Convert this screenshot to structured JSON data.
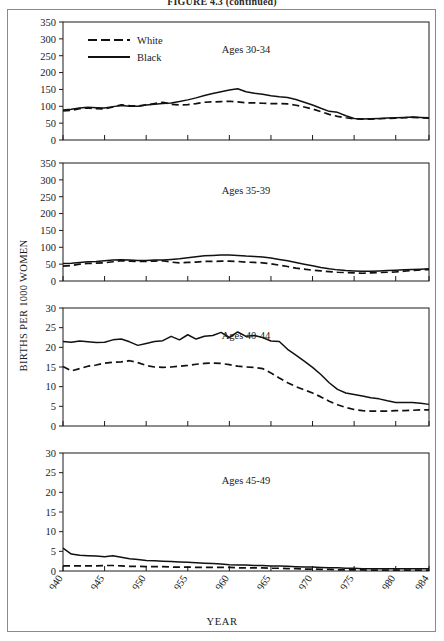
{
  "figure": {
    "title": "FIGURE 4.3 (continued)",
    "ylabel": "BIRTHS PER 1000 WOMEN",
    "xlabel": "YEAR"
  },
  "legend": {
    "position": "top-left-panel-1",
    "entries": [
      {
        "label": "White",
        "style": "dashed"
      },
      {
        "label": "Black",
        "style": "solid"
      }
    ]
  },
  "chart_data": [
    {
      "type": "line",
      "title": "Ages 30-34",
      "xlabel": "YEAR",
      "ylabel": "BIRTHS PER 1000 WOMEN",
      "xlim": [
        1940,
        1984
      ],
      "ylim": [
        0,
        350
      ],
      "yticks": [
        0,
        50,
        100,
        150,
        200,
        250,
        300,
        350
      ],
      "xticks": [
        1940,
        1945,
        1950,
        1955,
        1960,
        1965,
        1970,
        1975,
        1980,
        1984
      ],
      "grid": false,
      "legend": "top-left",
      "x": [
        1940,
        1941,
        1942,
        1943,
        1944,
        1945,
        1946,
        1947,
        1948,
        1949,
        1950,
        1951,
        1952,
        1953,
        1954,
        1955,
        1956,
        1957,
        1958,
        1959,
        1960,
        1961,
        1962,
        1963,
        1964,
        1965,
        1966,
        1967,
        1968,
        1969,
        1970,
        1971,
        1972,
        1973,
        1974,
        1975,
        1976,
        1977,
        1978,
        1979,
        1980,
        1981,
        1982,
        1983,
        1984
      ],
      "series": [
        {
          "name": "White",
          "style": "dashed",
          "values": [
            86,
            88,
            93,
            95,
            93,
            92,
            98,
            104,
            102,
            101,
            104,
            108,
            112,
            106,
            104,
            105,
            108,
            112,
            113,
            114,
            115,
            113,
            110,
            110,
            109,
            108,
            108,
            107,
            103,
            98,
            92,
            84,
            76,
            70,
            66,
            63,
            62,
            62,
            63,
            64,
            65,
            66,
            67,
            66,
            65
          ]
        },
        {
          "name": "Black",
          "style": "solid",
          "values": [
            89,
            91,
            95,
            97,
            96,
            95,
            99,
            102,
            100,
            100,
            104,
            106,
            108,
            110,
            114,
            119,
            125,
            132,
            138,
            143,
            148,
            152,
            143,
            139,
            136,
            131,
            128,
            126,
            120,
            112,
            104,
            94,
            85,
            82,
            72,
            64,
            62,
            63,
            64,
            65,
            66,
            67,
            68,
            67,
            66
          ]
        }
      ]
    },
    {
      "type": "line",
      "title": "Ages 35-39",
      "xlabel": "YEAR",
      "ylabel": "BIRTHS PER 1000 WOMEN",
      "xlim": [
        1940,
        1984
      ],
      "ylim": [
        0,
        350
      ],
      "yticks": [
        0,
        50,
        100,
        150,
        200,
        250,
        300,
        350
      ],
      "xticks": [
        1940,
        1945,
        1950,
        1955,
        1960,
        1965,
        1970,
        1975,
        1980,
        1984
      ],
      "grid": false,
      "x": [
        1940,
        1941,
        1942,
        1943,
        1944,
        1945,
        1946,
        1947,
        1948,
        1949,
        1950,
        1951,
        1952,
        1953,
        1954,
        1955,
        1956,
        1957,
        1958,
        1959,
        1960,
        1961,
        1962,
        1963,
        1964,
        1965,
        1966,
        1967,
        1968,
        1969,
        1970,
        1971,
        1972,
        1973,
        1974,
        1975,
        1976,
        1977,
        1978,
        1979,
        1980,
        1981,
        1982,
        1983,
        1984
      ],
      "series": [
        {
          "name": "White",
          "style": "dashed",
          "values": [
            44,
            46,
            50,
            52,
            53,
            54,
            57,
            60,
            59,
            58,
            58,
            59,
            60,
            56,
            54,
            55,
            56,
            58,
            58,
            59,
            59,
            58,
            56,
            55,
            54,
            51,
            47,
            43,
            38,
            35,
            32,
            30,
            28,
            26,
            25,
            24,
            23,
            24,
            25,
            26,
            27,
            29,
            31,
            33,
            34
          ]
        },
        {
          "name": "Black",
          "style": "solid",
          "values": [
            52,
            53,
            55,
            57,
            58,
            60,
            62,
            63,
            62,
            61,
            61,
            62,
            62,
            64,
            66,
            69,
            72,
            75,
            76,
            77,
            77,
            76,
            74,
            73,
            71,
            68,
            64,
            60,
            55,
            50,
            45,
            40,
            36,
            33,
            31,
            30,
            29,
            29,
            30,
            31,
            32,
            33,
            34,
            35,
            36
          ]
        }
      ]
    },
    {
      "type": "line",
      "title": "Ages 40-44",
      "xlabel": "YEAR",
      "ylabel": "BIRTHS PER 1000 WOMEN",
      "xlim": [
        1940,
        1984
      ],
      "ylim": [
        0,
        30
      ],
      "yticks": [
        0,
        5,
        10,
        15,
        20,
        25,
        30
      ],
      "xticks": [
        1940,
        1945,
        1950,
        1955,
        1960,
        1965,
        1970,
        1975,
        1980,
        1984
      ],
      "grid": false,
      "x": [
        1940,
        1941,
        1942,
        1943,
        1944,
        1945,
        1946,
        1947,
        1948,
        1949,
        1950,
        1951,
        1952,
        1953,
        1954,
        1955,
        1956,
        1957,
        1958,
        1959,
        1960,
        1961,
        1962,
        1963,
        1964,
        1965,
        1966,
        1967,
        1968,
        1969,
        1970,
        1971,
        1972,
        1973,
        1974,
        1975,
        1976,
        1977,
        1978,
        1979,
        1980,
        1981,
        1982,
        1983,
        1984
      ],
      "series": [
        {
          "name": "White",
          "style": "dashed",
          "values": [
            15.1,
            14.0,
            14.6,
            15.2,
            15.5,
            16.0,
            16.2,
            16.3,
            16.6,
            16.1,
            15.4,
            15.0,
            14.9,
            15.0,
            15.2,
            15.4,
            15.7,
            15.9,
            16.0,
            15.9,
            15.6,
            15.2,
            15.0,
            14.9,
            14.6,
            13.5,
            12.2,
            11.0,
            10.0,
            9.2,
            8.4,
            7.4,
            6.3,
            5.4,
            4.7,
            4.2,
            3.9,
            3.8,
            3.8,
            3.8,
            3.9,
            3.9,
            4.0,
            4.1,
            4.1
          ]
        },
        {
          "name": "Black",
          "style": "solid",
          "values": [
            21.5,
            21.3,
            21.6,
            21.4,
            21.2,
            21.3,
            21.9,
            22.1,
            21.4,
            20.5,
            21.0,
            21.5,
            21.7,
            22.8,
            21.9,
            23.2,
            22.1,
            22.8,
            23.0,
            23.8,
            22.5,
            23.9,
            22.8,
            23.0,
            22.5,
            21.6,
            21.5,
            19.5,
            18.0,
            16.5,
            14.9,
            13.1,
            11.0,
            9.3,
            8.4,
            8.0,
            7.6,
            7.2,
            6.9,
            6.4,
            6.0,
            6.0,
            6.0,
            5.8,
            5.5
          ]
        }
      ]
    },
    {
      "type": "line",
      "title": "Ages 45-49",
      "xlabel": "YEAR",
      "ylabel": "BIRTHS PER 1000 WOMEN",
      "xlim": [
        1940,
        1984
      ],
      "ylim": [
        0,
        30
      ],
      "yticks": [
        0,
        5,
        10,
        15,
        20,
        25,
        30
      ],
      "xticks": [
        1940,
        1945,
        1950,
        1955,
        1960,
        1965,
        1970,
        1975,
        1980,
        1984
      ],
      "grid": false,
      "x": [
        1940,
        1941,
        1942,
        1943,
        1944,
        1945,
        1946,
        1947,
        1948,
        1949,
        1950,
        1951,
        1952,
        1953,
        1954,
        1955,
        1956,
        1957,
        1958,
        1959,
        1960,
        1961,
        1962,
        1963,
        1964,
        1965,
        1966,
        1967,
        1968,
        1969,
        1970,
        1971,
        1972,
        1973,
        1974,
        1975,
        1976,
        1977,
        1978,
        1979,
        1980,
        1981,
        1982,
        1983,
        1984
      ],
      "series": [
        {
          "name": "White",
          "style": "dashed",
          "values": [
            1.3,
            1.3,
            1.3,
            1.3,
            1.3,
            1.4,
            1.4,
            1.3,
            1.2,
            1.2,
            1.1,
            1.1,
            1.1,
            1.0,
            1.0,
            1.0,
            0.9,
            0.9,
            0.9,
            0.9,
            0.9,
            0.8,
            0.8,
            0.8,
            0.8,
            0.7,
            0.7,
            0.6,
            0.6,
            0.5,
            0.5,
            0.4,
            0.4,
            0.3,
            0.3,
            0.3,
            0.3,
            0.2,
            0.2,
            0.2,
            0.2,
            0.2,
            0.2,
            0.2,
            0.2
          ]
        },
        {
          "name": "Black",
          "style": "solid",
          "values": [
            5.8,
            4.3,
            4.0,
            3.9,
            3.8,
            3.6,
            3.9,
            3.5,
            3.1,
            2.9,
            2.7,
            2.6,
            2.5,
            2.4,
            2.3,
            2.2,
            2.1,
            2.0,
            1.9,
            1.8,
            1.6,
            1.5,
            1.5,
            1.4,
            1.4,
            1.3,
            1.3,
            1.2,
            1.1,
            1.0,
            1.0,
            0.9,
            0.8,
            0.8,
            0.7,
            0.7,
            0.6,
            0.6,
            0.6,
            0.6,
            0.6,
            0.6,
            0.6,
            0.6,
            0.6
          ]
        }
      ]
    }
  ]
}
